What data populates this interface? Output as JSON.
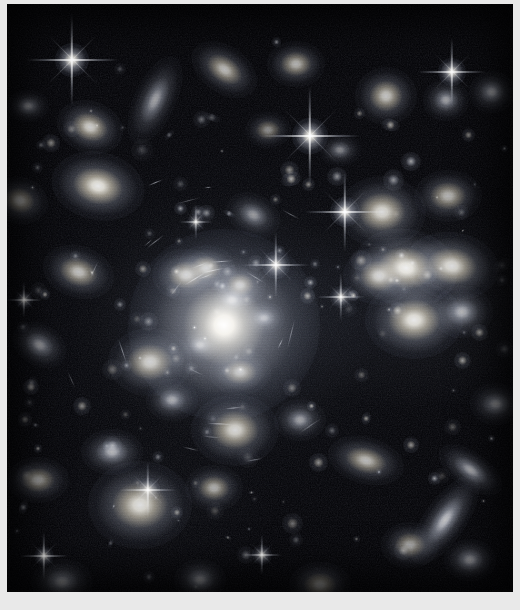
{
  "image": {
    "kind": "astronomical-deep-field",
    "subject": "galaxy cluster",
    "palette": {
      "background": "#000003",
      "mat": "#e9e9e9",
      "star_core": "#ffffff",
      "galaxy_warm": "#fbf6ea",
      "galaxy_cool": "#dfe4f0",
      "halo": "#9aa2b5"
    },
    "frame": {
      "width": 520,
      "height": 610,
      "plate_left": 7,
      "plate_top": 4,
      "plate_width": 506,
      "plate_height": 588
    }
  },
  "cluster": {
    "core_x": 225,
    "core_y": 320,
    "halo_radius_x": 210,
    "halo_radius_y": 175,
    "brightest_galaxy": {
      "x": 224,
      "y": 325,
      "size": 30,
      "brightness": 1.0
    }
  },
  "stars": [
    {
      "x": 72,
      "y": 60,
      "core": 5.0,
      "spike": 46,
      "b": 1.0
    },
    {
      "x": 310,
      "y": 136,
      "core": 5.2,
      "spike": 50,
      "b": 1.0
    },
    {
      "x": 452,
      "y": 72,
      "core": 4.2,
      "spike": 34,
      "b": 0.92
    },
    {
      "x": 345,
      "y": 212,
      "core": 4.4,
      "spike": 40,
      "b": 0.95
    },
    {
      "x": 276,
      "y": 265,
      "core": 4.0,
      "spike": 33,
      "b": 0.88
    },
    {
      "x": 341,
      "y": 297,
      "core": 3.2,
      "spike": 24,
      "b": 0.75
    },
    {
      "x": 148,
      "y": 490,
      "core": 3.4,
      "spike": 28,
      "b": 0.8
    },
    {
      "x": 44,
      "y": 556,
      "core": 3.0,
      "spike": 24,
      "b": 0.74
    },
    {
      "x": 262,
      "y": 555,
      "core": 2.8,
      "spike": 20,
      "b": 0.7
    },
    {
      "x": 24,
      "y": 300,
      "core": 2.6,
      "spike": 18,
      "b": 0.66
    },
    {
      "x": 196,
      "y": 222,
      "core": 2.6,
      "spike": 17,
      "b": 0.64
    }
  ],
  "galaxies": [
    {
      "x": 90,
      "y": 127,
      "rx": 13,
      "ry": 10,
      "rot": 20,
      "b": 0.8,
      "tone": "warm"
    },
    {
      "x": 155,
      "y": 100,
      "rx": 8,
      "ry": 18,
      "rot": 25,
      "b": 0.62,
      "tone": "cool"
    },
    {
      "x": 224,
      "y": 69,
      "rx": 14,
      "ry": 9,
      "rot": 35,
      "b": 0.72,
      "tone": "warm"
    },
    {
      "x": 296,
      "y": 64,
      "rx": 11,
      "ry": 9,
      "rot": 0,
      "b": 0.7,
      "tone": "warm"
    },
    {
      "x": 386,
      "y": 96,
      "rx": 12,
      "ry": 11,
      "rot": 0,
      "b": 0.76,
      "tone": "warm"
    },
    {
      "x": 446,
      "y": 100,
      "rx": 9,
      "ry": 8,
      "rot": 0,
      "b": 0.62,
      "tone": "cool"
    },
    {
      "x": 492,
      "y": 92,
      "rx": 9,
      "ry": 8,
      "rot": 0,
      "b": 0.58,
      "tone": "cool"
    },
    {
      "x": 20,
      "y": 200,
      "rx": 11,
      "ry": 9,
      "rot": 15,
      "b": 0.66,
      "tone": "warm"
    },
    {
      "x": 98,
      "y": 186,
      "rx": 18,
      "ry": 13,
      "rot": 12,
      "b": 0.92,
      "tone": "warm"
    },
    {
      "x": 254,
      "y": 215,
      "rx": 11,
      "ry": 8,
      "rot": 28,
      "b": 0.58,
      "tone": "cool"
    },
    {
      "x": 382,
      "y": 212,
      "rx": 17,
      "ry": 14,
      "rot": 0,
      "b": 0.86,
      "tone": "warm"
    },
    {
      "x": 448,
      "y": 196,
      "rx": 13,
      "ry": 10,
      "rot": 0,
      "b": 0.7,
      "tone": "warm"
    },
    {
      "x": 406,
      "y": 268,
      "rx": 20,
      "ry": 15,
      "rot": 10,
      "b": 0.95,
      "tone": "warm"
    },
    {
      "x": 452,
      "y": 266,
      "rx": 18,
      "ry": 13,
      "rot": 8,
      "b": 0.88,
      "tone": "warm"
    },
    {
      "x": 379,
      "y": 276,
      "rx": 14,
      "ry": 11,
      "rot": 0,
      "b": 0.8,
      "tone": "warm"
    },
    {
      "x": 414,
      "y": 320,
      "rx": 19,
      "ry": 15,
      "rot": 0,
      "b": 0.92,
      "tone": "warm"
    },
    {
      "x": 462,
      "y": 312,
      "rx": 12,
      "ry": 10,
      "rot": 0,
      "b": 0.72,
      "tone": "cool"
    },
    {
      "x": 78,
      "y": 272,
      "rx": 14,
      "ry": 10,
      "rot": 18,
      "b": 0.74,
      "tone": "warm"
    },
    {
      "x": 40,
      "y": 345,
      "rx": 11,
      "ry": 8,
      "rot": 30,
      "b": 0.6,
      "tone": "cool"
    },
    {
      "x": 150,
      "y": 362,
      "rx": 16,
      "ry": 13,
      "rot": 0,
      "b": 0.8,
      "tone": "warm"
    },
    {
      "x": 186,
      "y": 275,
      "rx": 13,
      "ry": 10,
      "rot": 0,
      "b": 0.78,
      "tone": "warm"
    },
    {
      "x": 206,
      "y": 268,
      "rx": 11,
      "ry": 9,
      "rot": 0,
      "b": 0.76,
      "tone": "warm"
    },
    {
      "x": 240,
      "y": 285,
      "rx": 10,
      "ry": 8,
      "rot": 0,
      "b": 0.72,
      "tone": "warm"
    },
    {
      "x": 232,
      "y": 300,
      "rx": 9,
      "ry": 7,
      "rot": 0,
      "b": 0.7,
      "tone": "cool"
    },
    {
      "x": 264,
      "y": 318,
      "rx": 8,
      "ry": 6,
      "rot": 0,
      "b": 0.62,
      "tone": "cool"
    },
    {
      "x": 200,
      "y": 345,
      "rx": 8,
      "ry": 6,
      "rot": 0,
      "b": 0.6,
      "tone": "cool"
    },
    {
      "x": 240,
      "y": 372,
      "rx": 12,
      "ry": 9,
      "rot": 0,
      "b": 0.7,
      "tone": "warm"
    },
    {
      "x": 172,
      "y": 400,
      "rx": 10,
      "ry": 8,
      "rot": 0,
      "b": 0.64,
      "tone": "cool"
    },
    {
      "x": 235,
      "y": 430,
      "rx": 17,
      "ry": 14,
      "rot": 0,
      "b": 0.84,
      "tone": "warm"
    },
    {
      "x": 300,
      "y": 420,
      "rx": 10,
      "ry": 8,
      "rot": 0,
      "b": 0.62,
      "tone": "cool"
    },
    {
      "x": 140,
      "y": 505,
      "rx": 20,
      "ry": 17,
      "rot": 0,
      "b": 0.88,
      "tone": "warm"
    },
    {
      "x": 214,
      "y": 488,
      "rx": 11,
      "ry": 9,
      "rot": 0,
      "b": 0.66,
      "tone": "warm"
    },
    {
      "x": 112,
      "y": 452,
      "rx": 12,
      "ry": 9,
      "rot": 0,
      "b": 0.68,
      "tone": "cool"
    },
    {
      "x": 366,
      "y": 460,
      "rx": 15,
      "ry": 9,
      "rot": 15,
      "b": 0.72,
      "tone": "warm"
    },
    {
      "x": 445,
      "y": 520,
      "rx": 8,
      "ry": 20,
      "rot": 35,
      "b": 0.76,
      "tone": "cool"
    },
    {
      "x": 470,
      "y": 470,
      "rx": 14,
      "ry": 7,
      "rot": 35,
      "b": 0.66,
      "tone": "cool"
    },
    {
      "x": 410,
      "y": 545,
      "rx": 11,
      "ry": 9,
      "rot": 0,
      "b": 0.64,
      "tone": "warm"
    },
    {
      "x": 470,
      "y": 560,
      "rx": 10,
      "ry": 8,
      "rot": 0,
      "b": 0.6,
      "tone": "cool"
    },
    {
      "x": 38,
      "y": 480,
      "rx": 12,
      "ry": 9,
      "rot": 0,
      "b": 0.62,
      "tone": "warm"
    },
    {
      "x": 62,
      "y": 582,
      "rx": 12,
      "ry": 9,
      "rot": 0,
      "b": 0.58,
      "tone": "cool"
    },
    {
      "x": 200,
      "y": 580,
      "rx": 10,
      "ry": 8,
      "rot": 0,
      "b": 0.56,
      "tone": "cool"
    },
    {
      "x": 320,
      "y": 585,
      "rx": 12,
      "ry": 9,
      "rot": 0,
      "b": 0.6,
      "tone": "warm"
    },
    {
      "x": 496,
      "y": 404,
      "rx": 10,
      "ry": 8,
      "rot": 0,
      "b": 0.58,
      "tone": "cool"
    },
    {
      "x": 28,
      "y": 106,
      "rx": 8,
      "ry": 6,
      "rot": 0,
      "b": 0.5,
      "tone": "cool"
    },
    {
      "x": 340,
      "y": 150,
      "rx": 8,
      "ry": 6,
      "rot": 0,
      "b": 0.5,
      "tone": "cool"
    },
    {
      "x": 268,
      "y": 130,
      "rx": 9,
      "ry": 7,
      "rot": 0,
      "b": 0.52,
      "tone": "warm"
    }
  ],
  "labels": {
    "alt": "Deep-field telescope image of a massive galaxy cluster",
    "title": "Galaxy Cluster Deep Field"
  }
}
